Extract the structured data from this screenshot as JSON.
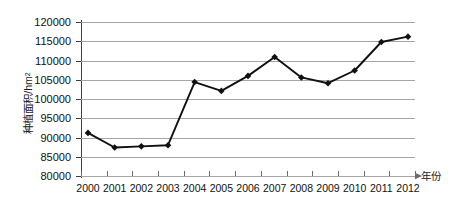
{
  "chart_data": {
    "type": "line",
    "title": "",
    "xlabel": "年份",
    "ylabel": "种植面积/hm",
    "ylabel_sup": "2",
    "categories": [
      "2000",
      "2001",
      "2002",
      "2003",
      "2004",
      "2005",
      "2006",
      "2007",
      "2008",
      "2009",
      "2010",
      "2011",
      "2012"
    ],
    "x": [
      2000,
      2001,
      2002,
      2003,
      2004,
      2005,
      2006,
      2007,
      2008,
      2009,
      2010,
      2011,
      2012
    ],
    "values": [
      91200,
      87400,
      87700,
      88000,
      104400,
      102100,
      106000,
      110900,
      105600,
      104100,
      107400,
      114800,
      116200
    ],
    "series": [
      {
        "name": "种植面积",
        "values": [
          91200,
          87400,
          87700,
          88000,
          104400,
          102100,
          106000,
          110900,
          105600,
          104100,
          107400,
          114800,
          116200
        ]
      }
    ],
    "ylim": [
      80000,
      120000
    ],
    "ytick_step": 5000,
    "yticks": [
      120000,
      115000,
      110000,
      105000,
      100000,
      95000,
      90000,
      85000,
      80000
    ],
    "ytick_labels": [
      "120000",
      "115000",
      "110000",
      "105000",
      "100000",
      "95000",
      "90000",
      "85000",
      "80000"
    ],
    "xlim": [
      2000,
      2012
    ],
    "grid": "horizontal",
    "legend": "none",
    "marker": "diamond",
    "line_color": "#111111",
    "marker_color": "#111111",
    "grid_color": "#a6a6a6",
    "axis_color": "#3f3f3f",
    "background": "#ffffff"
  }
}
